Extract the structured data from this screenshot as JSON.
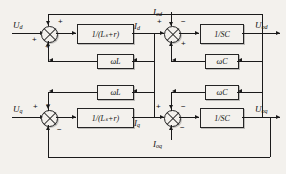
{
  "diagram": {
    "type": "control-block-diagram",
    "background_color": "#f3f1ed",
    "line_color": "#1a1a1a"
  },
  "inputs": [
    {
      "id": "u-d",
      "label": "U",
      "sub": "d",
      "row": "top"
    },
    {
      "id": "u-q",
      "label": "U",
      "sub": "q",
      "row": "bottom"
    }
  ],
  "outputs": [
    {
      "id": "u-od",
      "label": "U",
      "sub": "od",
      "row": "top"
    },
    {
      "id": "u-oq",
      "label": "U",
      "sub": "oq",
      "row": "bottom"
    }
  ],
  "disturbances": [
    {
      "id": "i-od",
      "label": "I",
      "sub": "od",
      "row": "top"
    },
    {
      "id": "i-oq",
      "label": "I",
      "sub": "oq",
      "row": "bottom"
    }
  ],
  "states": [
    {
      "id": "i-d",
      "label": "I",
      "sub": "d",
      "row": "top"
    },
    {
      "id": "i-q",
      "label": "I",
      "sub": "q",
      "row": "bottom"
    }
  ],
  "blocks": [
    {
      "id": "plant-d",
      "label": "1/(Lₛ+r)",
      "row": "top",
      "kind": "transfer-function"
    },
    {
      "id": "plant-q",
      "label": "1/(Lₛ+r)",
      "row": "bottom",
      "kind": "transfer-function"
    },
    {
      "id": "cap-d",
      "label": "1/SC",
      "row": "top",
      "kind": "transfer-function"
    },
    {
      "id": "cap-q",
      "label": "1/SC",
      "row": "bottom",
      "kind": "transfer-function"
    },
    {
      "id": "wl-top",
      "label": "ωL",
      "row": "top",
      "kind": "cross-coupling-gain"
    },
    {
      "id": "wl-bottom",
      "label": "ωL",
      "row": "bottom",
      "kind": "cross-coupling-gain"
    },
    {
      "id": "wc-top",
      "label": "ωC",
      "row": "top",
      "kind": "cross-coupling-gain"
    },
    {
      "id": "wc-bottom",
      "label": "ωC",
      "row": "bottom",
      "kind": "cross-coupling-gain"
    }
  ],
  "summing_junctions": [
    {
      "id": "sum-1",
      "row": "top",
      "position": "input-d",
      "signs": [
        "+",
        "+",
        "+"
      ]
    },
    {
      "id": "sum-2",
      "row": "top",
      "position": "cap-d",
      "signs": [
        "+",
        "−",
        "+"
      ]
    },
    {
      "id": "sum-3",
      "row": "bottom",
      "position": "input-q",
      "signs": [
        "+",
        "−",
        "−"
      ]
    },
    {
      "id": "sum-4",
      "row": "bottom",
      "position": "cap-q",
      "signs": [
        "+",
        "−",
        "−"
      ]
    }
  ],
  "signs": {
    "plus": "+",
    "minus": "−"
  }
}
